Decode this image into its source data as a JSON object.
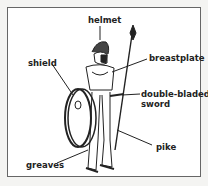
{
  "diagram": {
    "labels": {
      "helmet": "helmet",
      "breastplate": "breastplate",
      "shield": "shield",
      "sword_line1": "double-bladed",
      "sword_line2": "sword",
      "pike": "pike",
      "greaves": "greaves"
    }
  }
}
